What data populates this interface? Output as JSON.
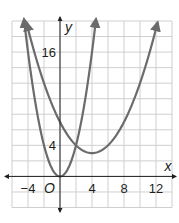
{
  "chart_data": {
    "type": "line",
    "title": "",
    "xlabel": "x",
    "ylabel": "y",
    "origin_label": "O",
    "xlim": [
      -6,
      14
    ],
    "ylim": [
      -4,
      20
    ],
    "grid": true,
    "grid_step": 2,
    "x_ticks": [
      -4,
      4,
      8,
      12
    ],
    "x_tick_labels": [
      "−4",
      "4",
      "8",
      "12"
    ],
    "y_ticks": [
      4,
      16
    ],
    "y_tick_labels": [
      "4",
      "16"
    ],
    "series": [
      {
        "name": "steep parabola",
        "equation": "y = x^2",
        "vertex": [
          0,
          0
        ],
        "x": [
          -4.5,
          -4,
          -3,
          -2,
          -1,
          0,
          1,
          2,
          3,
          4,
          4.5
        ],
        "values": [
          20.25,
          16,
          9,
          4,
          1,
          0,
          1,
          4,
          9,
          16,
          20.25
        ]
      },
      {
        "name": "wide parabola",
        "equation": "y = 0.25(x - 4)^2 + 3",
        "vertex": [
          4,
          3
        ],
        "x": [
          -4.2,
          -4,
          0,
          2,
          4,
          6,
          8,
          12,
          12.2
        ],
        "values": [
          19.8,
          19,
          7,
          4,
          3,
          4,
          7,
          19,
          19.8
        ]
      }
    ],
    "colors": {
      "curve": "#6b6b6b",
      "grid": "#cfcfcf",
      "axis": "#231f20"
    }
  }
}
